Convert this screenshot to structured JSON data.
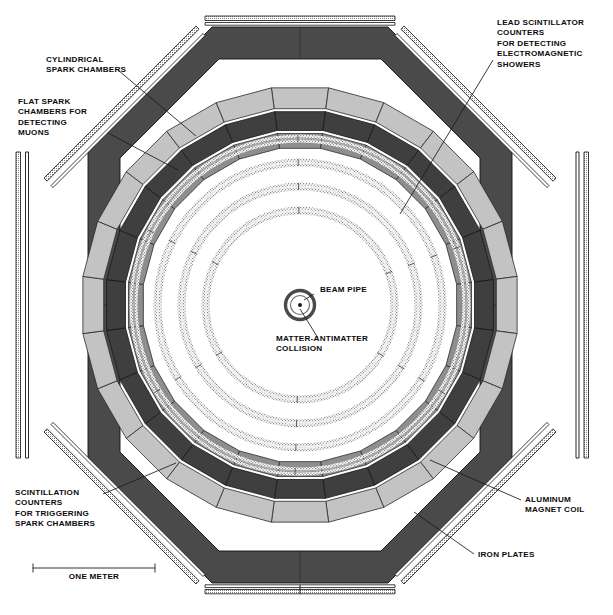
{
  "diagram": {
    "scale_bar": {
      "label": "ONE METER",
      "length_px": 122
    },
    "center": {
      "x": 300,
      "y": 305
    }
  },
  "labels": {
    "cylindrical_spark_chambers": "CYLINDRICAL\nSPARK CHAMBERS",
    "flat_spark_chambers": "FLAT SPARK\nCHAMBERS FOR\nDETECTING\nMUONS",
    "lead_scintillator": "LEAD SCINTILLATOR\nCOUNTERS\nFOR DETECTING\nELECTROMAGNETIC\nSHOWERS",
    "beam_pipe": "BEAM PIPE",
    "matter_antimatter": "MATTER-ANTIMATTER\nCOLLISION",
    "scintillation_counters": "SCINTILLATION\nCOUNTERS\nFOR TRIGGERING\nSPARK CHAMBERS",
    "aluminum_magnet_coil": "ALUMINUM\nMAGNET COIL",
    "iron_plates": "IRON PLATES",
    "one_meter": "ONE METER"
  },
  "colors": {
    "iron_dark": "#4a4a4a",
    "lead_scint_mid": "#8e8e8e",
    "scintillator_light": "#c3c3c3",
    "magnet_coil_dark": "#3f3f3f",
    "stipple": "#9b9b9b",
    "outline": "#1a1a1a",
    "text": "#0b0b0b",
    "background": "#ffffff"
  },
  "components": [
    {
      "name": "iron-plates-octagon",
      "kind": "octagon-band",
      "fill": "#4a4a4a"
    },
    {
      "name": "flat-spark-chambers",
      "kind": "thin-strips",
      "fill": "#b9b9b9"
    },
    {
      "name": "scintillation-counters-ring",
      "kind": "segmented-polygon",
      "fill": "#c3c3c3",
      "segments": 24
    },
    {
      "name": "aluminum-magnet-coil-ring",
      "kind": "segmented-polygon",
      "fill": "#3f3f3f",
      "segments": 24
    },
    {
      "name": "lead-scintillator-ring",
      "kind": "segmented-polygon",
      "fill": "#8e8e8e",
      "segments": 24
    },
    {
      "name": "cylindrical-spark-chambers",
      "kind": "stippled-rings",
      "count": 4,
      "radii": [
        92,
        116,
        140,
        164
      ]
    },
    {
      "name": "beam-pipe",
      "kind": "concentric-circles",
      "radii": [
        9,
        14
      ]
    }
  ]
}
